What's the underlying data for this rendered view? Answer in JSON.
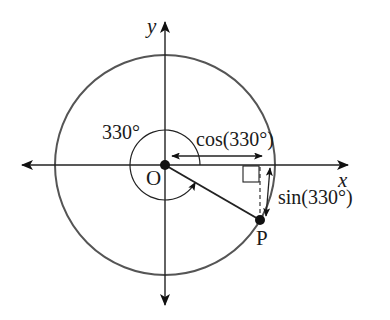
{
  "figure": {
    "type": "unit-circle-diagram",
    "axes": {
      "x_label": "x",
      "y_label": "y"
    },
    "origin_label": "O",
    "point_label": "P",
    "angle_label": "330°",
    "cos_label": "cos(330°)",
    "sin_label": "sin(330°)",
    "angle_degrees": 330,
    "colors": {
      "circle": "#555555",
      "axes": "#222222",
      "ink": "#111111"
    }
  }
}
